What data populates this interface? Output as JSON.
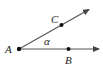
{
  "diagram": {
    "type": "angle",
    "vertex": {
      "label": "A",
      "x": 19,
      "y": 49
    },
    "points": [
      {
        "label": "C",
        "x": 61,
        "y": 25,
        "on_ray": "upper"
      },
      {
        "label": "B",
        "x": 68,
        "y": 49,
        "on_ray": "lower"
      }
    ],
    "rays": [
      {
        "name": "AC",
        "from": [
          19,
          49
        ],
        "to": [
          90,
          9
        ]
      },
      {
        "name": "AB",
        "from": [
          19,
          49
        ],
        "to": [
          100,
          49
        ]
      }
    ],
    "angle_label": "α",
    "color": "#222222"
  }
}
